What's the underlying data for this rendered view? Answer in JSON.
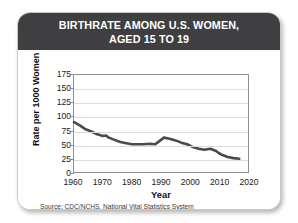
{
  "card": {
    "title_line1": "BIRTHRATE AMONG U.S. WOMEN,",
    "title_line2": "AGED 15 TO 19",
    "source": "Source: CDC/NCHS, National Vital Statistics System",
    "header_color": "#3f3f41",
    "background_color": "#ffffff",
    "line_color": "#4a4a4a",
    "grid_color": "#dcdcdc",
    "axis_color": "#8e8e8e"
  },
  "chart_data": {
    "type": "line",
    "title": "BIRTHRATE AMONG U.S. WOMEN, AGED 15 TO 19",
    "subtitle": "",
    "xlabel": "Year",
    "ylabel": "Rate per 1000 Women",
    "xlim": [
      1960,
      2020
    ],
    "ylim": [
      0,
      175
    ],
    "xticks": [
      1960,
      1970,
      1980,
      1990,
      2000,
      2010,
      2020
    ],
    "yticks": [
      0,
      25,
      50,
      75,
      100,
      125,
      150,
      175
    ],
    "grid": "horizontal",
    "legend": "none",
    "annotation": "Source: CDC/NCHS, National Vital Statistics System",
    "series": [
      {
        "name": "Birthrate per 1000 women aged 15 to 19",
        "x": [
          1960,
          1962,
          1964,
          1966,
          1968,
          1970,
          1971,
          1972,
          1974,
          1976,
          1978,
          1980,
          1982,
          1984,
          1986,
          1988,
          1990,
          1991,
          1993,
          1995,
          1997,
          1999,
          2001,
          2003,
          2005,
          2007,
          2009,
          2010,
          2011,
          2013,
          2015,
          2017
        ],
        "y": [
          90,
          84,
          77,
          73,
          68,
          65,
          66,
          62,
          58,
          54,
          52,
          50,
          50,
          50,
          51,
          50,
          58,
          62,
          60,
          57,
          53,
          50,
          45,
          42,
          40,
          42,
          38,
          34,
          31,
          27,
          25,
          24
        ]
      }
    ]
  }
}
